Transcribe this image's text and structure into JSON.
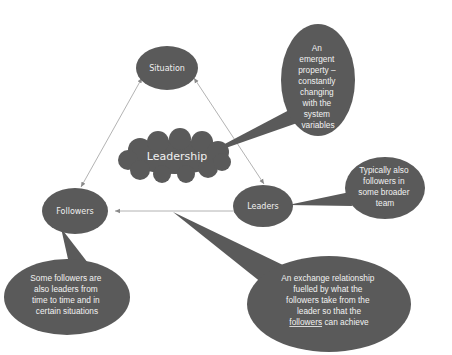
{
  "diagram": {
    "colors": {
      "shape_fill": "#5a5a5a",
      "text": "#f0f0f0",
      "connector": "#9a9a9a",
      "background": "#ffffff"
    },
    "nodes": {
      "situation": {
        "label": "Situation"
      },
      "leadership": {
        "label": "Leadership"
      },
      "leaders": {
        "label": "Leaders"
      },
      "followers": {
        "label": "Followers"
      }
    },
    "callouts": {
      "emergent": {
        "lines": [
          "An",
          "emergent",
          "property –",
          "constantly",
          "changing",
          "with the",
          "system",
          "variables"
        ]
      },
      "leaders_note": {
        "lines": [
          "Typically also",
          "followers in",
          "some broader",
          "team"
        ]
      },
      "followers_note": {
        "lines": [
          "Some followers are",
          "also leaders from",
          "time to time and in",
          "certain situations"
        ]
      },
      "exchange": {
        "lines": [
          "An exchange relationship",
          "fuelled by what the",
          "followers take from the",
          "leader so that the"
        ],
        "last_line_underlined": "followers",
        "last_line_rest": " can achieve"
      }
    },
    "connectors": [
      {
        "from": "situation",
        "to": "followers",
        "type": "double-arrow"
      },
      {
        "from": "situation",
        "to": "leaders",
        "type": "double-arrow"
      },
      {
        "from": "followers",
        "to": "leaders",
        "type": "double-arrow"
      }
    ]
  }
}
